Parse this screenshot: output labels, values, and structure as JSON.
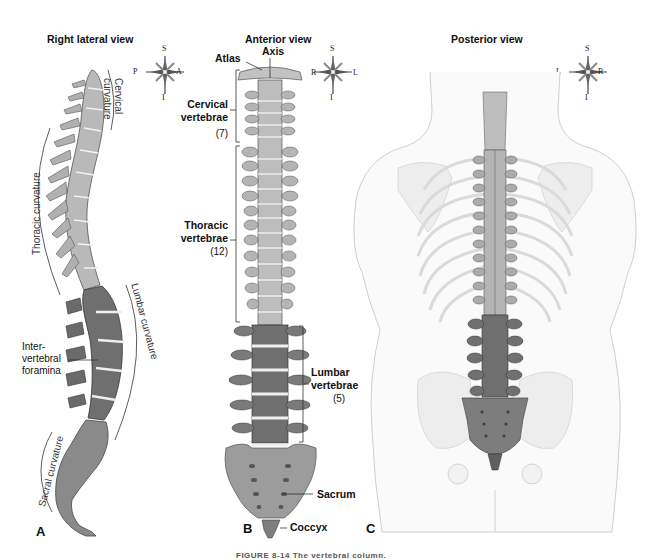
{
  "figure": {
    "caption": "FIGURE 8-14 The vertebral column."
  },
  "panels": {
    "a": {
      "title": "Right lateral view",
      "letter": "A",
      "compass": {
        "top": "S",
        "bottom": "I",
        "left": "P",
        "right": "A"
      },
      "curvatures": {
        "cervical_line1": "Cervical",
        "cervical_line2": "curvature",
        "thoracic": "Thoracic curvature",
        "lumbar": "Lumbar curvature",
        "sacral": "Sacral curvature"
      },
      "foramina_label": {
        "line1": "Inter-",
        "line2": "vertebral",
        "line3": "foramina"
      }
    },
    "b": {
      "title": "Anterior view",
      "letter": "B",
      "compass": {
        "top": "S",
        "bottom": "I",
        "left": "R",
        "right": "L"
      },
      "labels": {
        "atlas": "Atlas",
        "axis": "Axis",
        "cervical_line1": "Cervical",
        "cervical_line2": "vertebrae",
        "cervical_count": "(7)",
        "thoracic_line1": "Thoracic",
        "thoracic_line2": "vertebrae",
        "thoracic_count": "(12)",
        "lumbar_line1": "Lumbar",
        "lumbar_line2": "vertebrae",
        "lumbar_count": "(5)",
        "sacrum": "Sacrum",
        "coccyx": "Coccyx"
      }
    },
    "c": {
      "title": "Posterior view",
      "letter": "C",
      "compass": {
        "top": "S",
        "bottom": "I",
        "left": "L",
        "right": "R"
      }
    }
  },
  "colors": {
    "cervical_thoracic": "#b9b9b9",
    "lumbar": "#6f6f6f",
    "sacrum": "#8a8a8a",
    "disc": "#ececec",
    "body_outline": "#cfcfcf"
  }
}
